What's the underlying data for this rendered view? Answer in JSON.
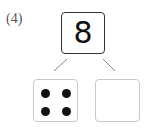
{
  "problem": {
    "label": "(4)",
    "total": "8",
    "parts": [
      {
        "type": "dots",
        "count": 4
      },
      {
        "type": "blank",
        "value": ""
      }
    ]
  }
}
